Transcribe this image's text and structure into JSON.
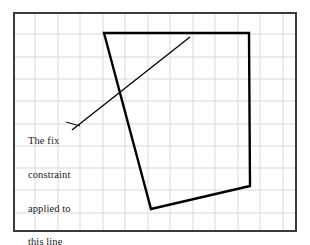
{
  "figure": {
    "name": "fix-constraint-sketch",
    "background_color": "#ffffff",
    "frame": {
      "name": "plot-frame",
      "x": 13,
      "y": 12,
      "width": 284,
      "height": 220,
      "border_color": "#3b3b3b",
      "border_width": 2,
      "fill_color": "#ffffff"
    },
    "grid": {
      "name": "background-grid",
      "color": "#d9d9d9",
      "line_width": 1,
      "spacing": 22.4,
      "vertical_lines": [
        35,
        58,
        80,
        103,
        125,
        148,
        170,
        193,
        215,
        238,
        260,
        283
      ],
      "horizontal_lines": [
        34,
        57,
        79,
        101,
        124,
        146,
        168,
        190,
        213
      ]
    },
    "shapes": [
      {
        "name": "quadrilateral",
        "type": "polygon",
        "stroke_color": "#000000",
        "stroke_width": 2.4,
        "fill": "none",
        "points": [
          [
            104,
            33
          ],
          [
            249,
            33
          ],
          [
            250,
            186
          ],
          [
            151,
            209
          ]
        ]
      },
      {
        "name": "fixed-line",
        "type": "line",
        "stroke_color": "#000000",
        "stroke_width": 1.3,
        "x1": 72,
        "y1": 130,
        "x2": 190,
        "y2": 37
      },
      {
        "name": "leader-line",
        "type": "line",
        "stroke_color": "#000000",
        "stroke_width": 1,
        "x1": 66,
        "y1": 122,
        "x2": 80,
        "y2": 126
      }
    ],
    "annotation": {
      "name": "fix-constraint-label",
      "color": "#1a1a1a",
      "lines": [
        "The fix",
        "constraint",
        "applied to",
        "this line"
      ],
      "full_text": "The fix constraint applied to this line"
    }
  }
}
